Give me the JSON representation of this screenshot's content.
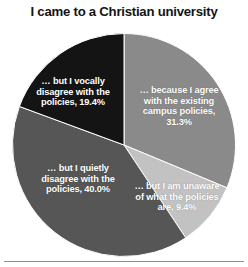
{
  "chart_data": {
    "type": "pie",
    "title": "I came to a Christian university",
    "xlabel": "",
    "ylabel": "",
    "legend": "none",
    "grid": false,
    "start_angle_deg": 0,
    "direction": "clockwise",
    "categories": [
      "… because I agree with the existing campus policies",
      "… but I am unaware of what the policies are",
      "… but I quietly disagree with the policies",
      "… but I vocally disagree with the policies"
    ],
    "values": [
      31.3,
      9.4,
      40.0,
      19.4
    ],
    "value_unit": "percent",
    "colors": [
      "#8a8a8a",
      "#c2c2c2",
      "#565656",
      "#141414"
    ],
    "labels": [
      "… because I agree with the existing campus policies, 31.3%",
      "… but I am unaware of what the policies are, 9.4%",
      "… but I quietly disagree with the policies, 40.0%",
      "… but I vocally disagree with the policies, 19.4%"
    ],
    "label_color": "#ffffff",
    "slices": [
      {
        "name": "agree-with-existing-campus-policies",
        "label": "… because I agree with the existing campus policies, 31.3%",
        "value": 31.3,
        "color": "#8a8a8a"
      },
      {
        "name": "unaware-of-policies",
        "label": "… but I am unaware of what the policies are, 9.4%",
        "value": 9.4,
        "color": "#c2c2c2"
      },
      {
        "name": "quietly-disagree",
        "label": "… but I quietly disagree with the policies, 40.0%",
        "value": 40.0,
        "color": "#565656"
      },
      {
        "name": "vocally-disagree",
        "label": "… but I vocally disagree with the policies, 19.4%",
        "value": 19.4,
        "color": "#141414"
      }
    ]
  },
  "figure": {
    "title": "I came to a Christian university",
    "title_color": "#141414",
    "background": "#ffffff",
    "rule_color": "#8e8e8e"
  }
}
